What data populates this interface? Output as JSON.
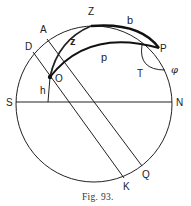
{
  "figure": {
    "caption": "Fig. 93.",
    "labels": {
      "Z": "Z",
      "b": "b",
      "A": "A",
      "D": "D",
      "z": "z",
      "P": "P",
      "p": "p",
      "O": "O",
      "T": "T",
      "phi": "φ",
      "h": "h",
      "S": "S",
      "N": "N",
      "Q": "Q",
      "K": "K"
    },
    "colors": {
      "stroke": "#222222",
      "background": "#ffffff"
    }
  }
}
